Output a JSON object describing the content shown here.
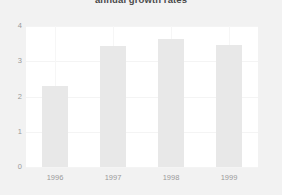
{
  "chart_data": {
    "type": "bar",
    "title": "annual growth rates",
    "xlabel": "",
    "ylabel": "",
    "categories": [
      "1996",
      "1997",
      "1998",
      "1999"
    ],
    "values": [
      2.3,
      3.43,
      3.63,
      3.46
    ],
    "ylim": [
      0,
      4
    ],
    "yticks": [
      "0",
      "1",
      "2",
      "3",
      "4"
    ],
    "ytick_values": [
      0,
      1,
      2,
      3,
      4
    ],
    "grid": true,
    "legend": false,
    "legend_position": "none",
    "colors": {
      "bar_fill": "#e8e8e8",
      "plot_background": "#ffffff",
      "figure_background": "#f2f2f2",
      "tick_label": "#9a9a9a",
      "title": "#4a4a4a",
      "gridline": "#f4f4f4"
    }
  }
}
